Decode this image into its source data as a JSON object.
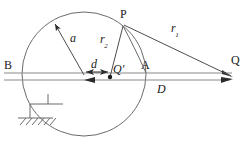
{
  "figure": {
    "type": "geometry-diagram",
    "width": 249,
    "height": 141,
    "background_color": "#ffffff",
    "stroke_color": "#4d4d4d",
    "label_color": "#1a1a1a"
  },
  "labels": {
    "point_b": "B",
    "point_a": "A",
    "point_p": "P",
    "point_q": "Q",
    "point_q_prime": "Q′",
    "radius_a": "a",
    "offset_d": "d",
    "distance_d_big": "D",
    "radius_r1": "r",
    "radius_r1_sub": "1",
    "radius_r2": "r",
    "radius_r2_sub": "2"
  },
  "geometry": {
    "circle": {
      "cx": 84,
      "cy": 74,
      "r": 62
    },
    "center": {
      "x": 84,
      "y": 75
    },
    "point_q_prime": {
      "x": 110,
      "y": 77
    },
    "point_p": {
      "x": 123,
      "y": 25
    },
    "point_q": {
      "x": 233,
      "y": 77
    },
    "point_a_on_circle": {
      "x": 146,
      "y": 74
    },
    "point_b_on_circle": {
      "x": 22,
      "y": 74
    },
    "radius_arrow_tip": {
      "x": 53,
      "y": 22
    },
    "axis_top_y": 73,
    "axis_bottom_y": 80,
    "ground_support": {
      "x": 38,
      "y": 106,
      "hatch_count": 6
    }
  }
}
